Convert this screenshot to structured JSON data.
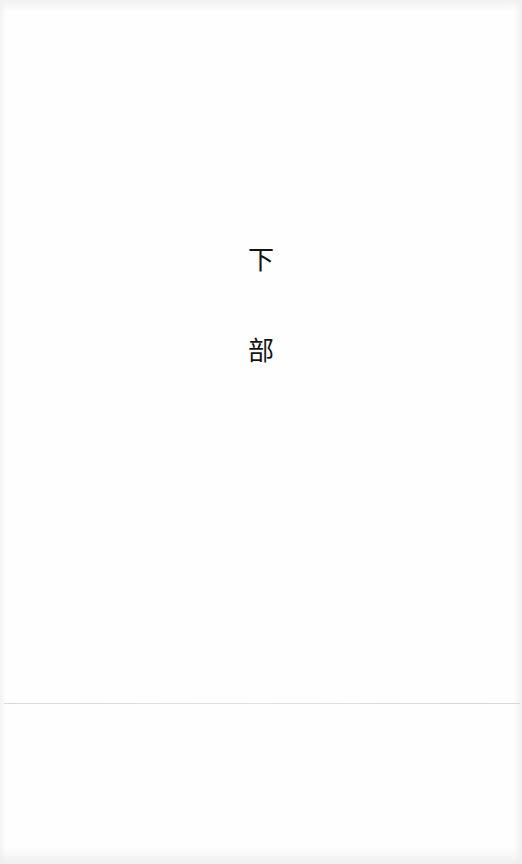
{
  "document": {
    "title_characters": [
      "下",
      "部"
    ],
    "colors": {
      "paper": "#fefefe",
      "ink": "#141414",
      "rule": "#dcdcdc"
    }
  }
}
